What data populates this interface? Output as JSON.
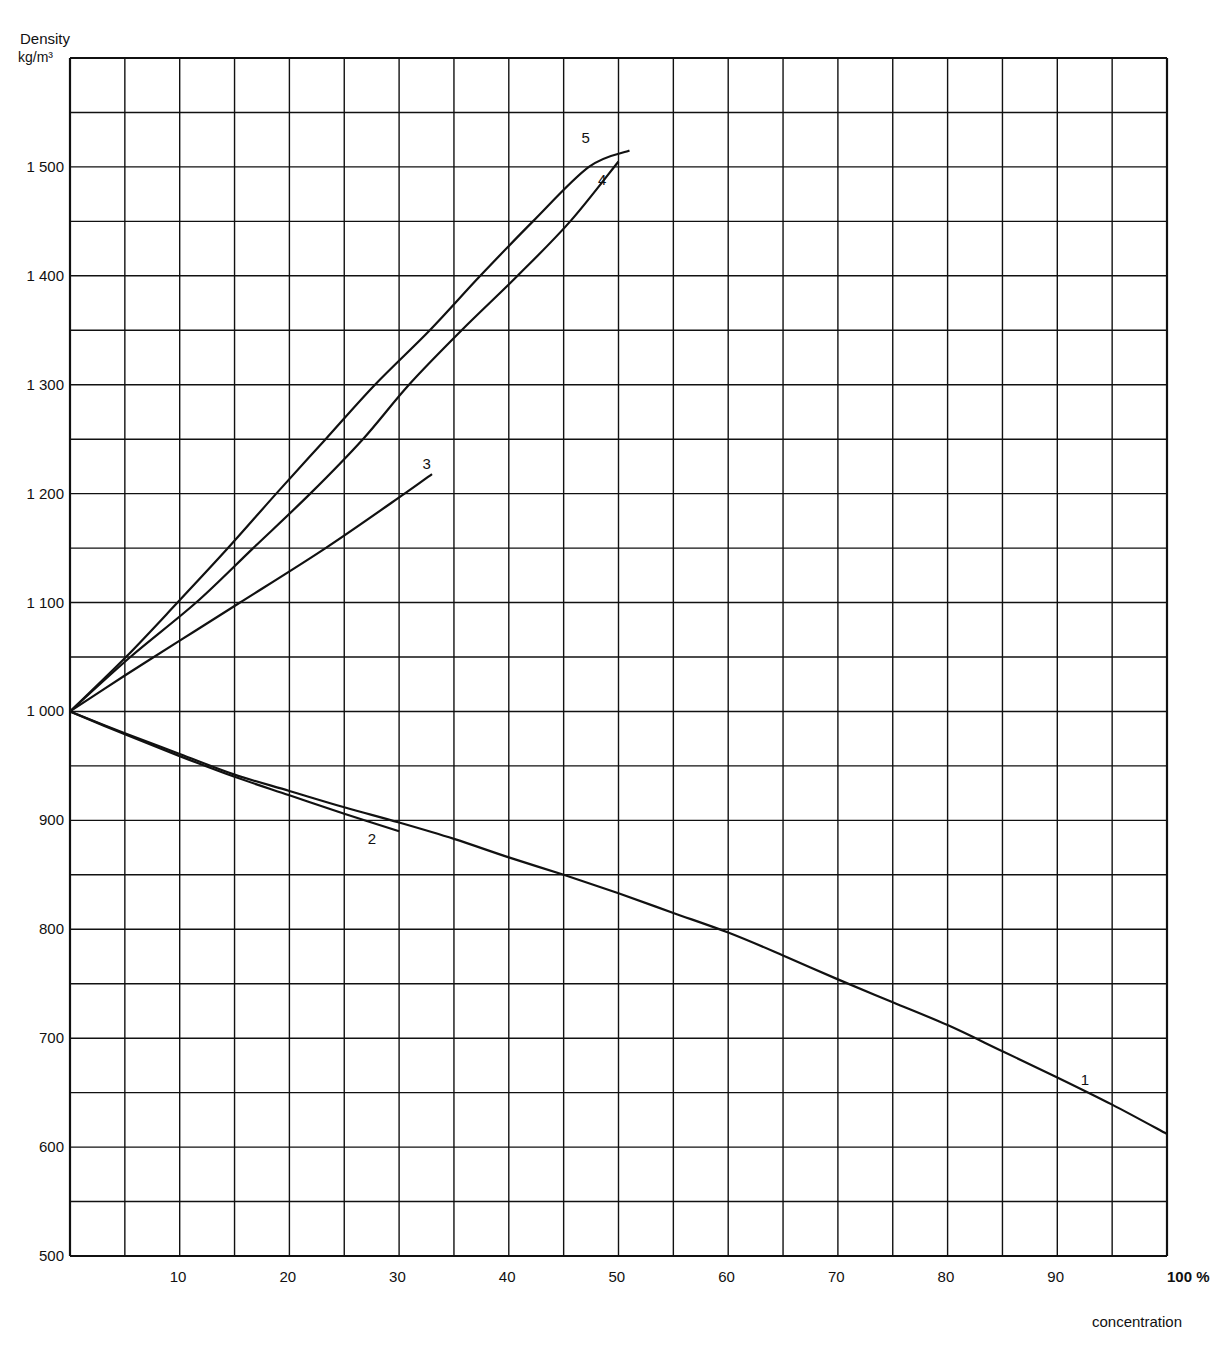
{
  "chart_data": {
    "type": "line",
    "title": "",
    "ylabel": "Density",
    "yunit": "kg/m³",
    "xlabel": "concentration",
    "xunit": "%",
    "xlim": [
      0,
      100
    ],
    "ylim": [
      500,
      1600
    ],
    "grid": true,
    "x_ticks": [
      10,
      20,
      30,
      40,
      50,
      60,
      70,
      80,
      90,
      100
    ],
    "x_tick_labels": [
      "10",
      "20",
      "30",
      "40",
      "50",
      "60",
      "70",
      "80",
      "90",
      "100 %"
    ],
    "y_ticks": [
      500,
      600,
      700,
      800,
      900,
      1000,
      1100,
      1200,
      1300,
      1400,
      1500
    ],
    "y_tick_labels": [
      "500",
      "600",
      "700",
      "800",
      "900",
      "1 000",
      "1 100",
      "1 200",
      "1 300",
      "1 400",
      "1 500"
    ],
    "grid_x_step": 5,
    "grid_y_step": 50,
    "series": [
      {
        "name": "1",
        "x": [
          0,
          5,
          10,
          15,
          20,
          25,
          30,
          35,
          40,
          45,
          50,
          55,
          60,
          65,
          70,
          75,
          80,
          85,
          90,
          95,
          100
        ],
        "y": [
          1000,
          980,
          961,
          942,
          927,
          912,
          898,
          883,
          866,
          850,
          833,
          815,
          797,
          776,
          754,
          733,
          712,
          688,
          664,
          639,
          612
        ]
      },
      {
        "name": "2",
        "x": [
          0,
          5,
          10,
          15,
          20,
          25,
          30
        ],
        "y": [
          1000,
          979,
          959,
          940,
          923,
          906,
          890
        ]
      },
      {
        "name": "3",
        "x": [
          0,
          5,
          10,
          15.5,
          23.3,
          30.5,
          33
        ],
        "y": [
          1000,
          1033,
          1065,
          1100,
          1150,
          1200,
          1218
        ]
      },
      {
        "name": "4",
        "x": [
          0,
          5.5,
          11.5,
          16.7,
          21.9,
          26.7,
          30.9,
          35.7,
          40.8,
          45.6,
          50
        ],
        "y": [
          1000,
          1050,
          1100,
          1150,
          1200,
          1250,
          1300,
          1350,
          1400,
          1450,
          1505
        ]
      },
      {
        "name": "5",
        "x": [
          0,
          5.1,
          9.8,
          14.4,
          18.8,
          23.3,
          27.8,
          32.8,
          37.4,
          42.2,
          47.3,
          51
        ],
        "y": [
          1000,
          1050,
          1100,
          1150,
          1200,
          1250,
          1300,
          1350,
          1400,
          1450,
          1500,
          1515
        ]
      }
    ],
    "curve_labels": [
      {
        "text": "1",
        "x": 92.5,
        "y": 662
      },
      {
        "text": "2",
        "x": 27.5,
        "y": 883
      },
      {
        "text": "3",
        "x": 32.5,
        "y": 1227
      },
      {
        "text": "4",
        "x": 48.5,
        "y": 1488
      },
      {
        "text": "5",
        "x": 47,
        "y": 1527
      }
    ]
  },
  "axis": {
    "y_title": "Density",
    "y_unit": "kg/m³",
    "x_title": "concentration"
  }
}
